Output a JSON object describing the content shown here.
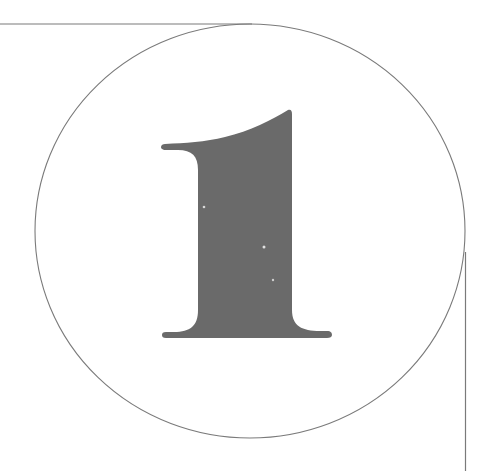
{
  "figure": {
    "numeral": "1",
    "colors": {
      "background": "#ffffff",
      "glyph_fill": "#6a6a6a",
      "line_stroke": "#7a7a7a"
    },
    "elements": [
      "horizontal-rule-top-left",
      "circle-frame",
      "numeral-one",
      "vertical-rule-bottom-right"
    ]
  }
}
